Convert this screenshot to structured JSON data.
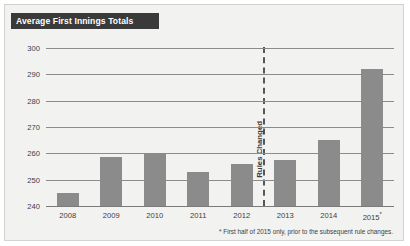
{
  "card": {
    "title": "Average First Innings Totals",
    "title_bg": "#3a3a3a",
    "title_color": "#ffffff",
    "background": "#f2f2f1",
    "border_color": "#d2d2d0"
  },
  "footnote": "* First half of 2015 only, prior to the subsequent rule changes.",
  "annotation": {
    "label": "Rules Changed",
    "between": [
      "2012",
      "2013"
    ],
    "style": "dashed-vertical-line",
    "color": "#565656"
  },
  "chart_data": {
    "type": "bar",
    "title": "Average First Innings Totals",
    "xlabel": "",
    "ylabel": "",
    "categories": [
      "2008",
      "2009",
      "2010",
      "2011",
      "2012",
      "2013",
      "2014",
      "2015 *"
    ],
    "values": [
      245,
      258.5,
      260,
      253,
      256,
      257.5,
      265,
      292
    ],
    "ylim": [
      240,
      300
    ],
    "yticks": [
      240,
      250,
      260,
      270,
      280,
      290,
      300
    ],
    "ytick_labels": [
      "240",
      "250",
      "260",
      "270",
      "280",
      "290",
      "300"
    ],
    "grid": true,
    "legend": "none",
    "bar_color": "#8b8b8b",
    "gridline_color": "#8c8c8c",
    "annotations": [
      {
        "text": "Rules Changed",
        "type": "vline",
        "position_between": [
          "2012",
          "2013"
        ],
        "orientation": "vertical"
      },
      {
        "text": "* First half of 2015 only, prior to the subsequent rule changes.",
        "type": "footnote"
      }
    ]
  }
}
